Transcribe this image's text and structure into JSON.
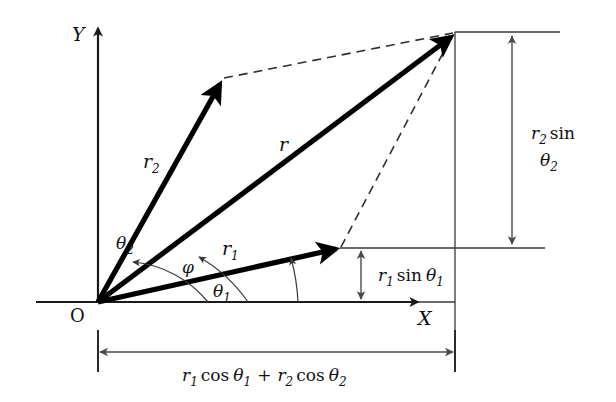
{
  "figure": {
    "type": "vector-addition-parallelogram-diagram",
    "axes": {
      "x_label": "X",
      "y_label": "Y",
      "origin_label": "O"
    },
    "vectors": [
      {
        "name": "r2-vector",
        "label": "r",
        "subscript": "2"
      },
      {
        "name": "resultant-vector",
        "label": "r",
        "subscript": ""
      },
      {
        "name": "r1-vector",
        "label": "r",
        "subscript": "1"
      }
    ],
    "angles": [
      {
        "name": "theta2",
        "symbol": "θ",
        "subscript": "2"
      },
      {
        "name": "phi",
        "symbol": "φ",
        "subscript": ""
      },
      {
        "name": "theta1",
        "symbol": "θ",
        "subscript": "1"
      }
    ],
    "dimensions": {
      "vertical_upper": {
        "prefix": "r",
        "prefix_sub": "2",
        "func": "sin",
        "arg": "θ",
        "arg_sub": "2",
        "full": "r2 sin θ2"
      },
      "vertical_lower": {
        "prefix": "r",
        "prefix_sub": "1",
        "func": "sin",
        "arg": "θ",
        "arg_sub": "1",
        "full": "r1 sin θ1"
      },
      "horizontal_bottom": {
        "term1_prefix": "r",
        "term1_sub": "1",
        "term1_func": "cos",
        "term1_arg": "θ",
        "term1_arg_sub": "1",
        "operator": "+",
        "term2_prefix": "r",
        "term2_sub": "2",
        "term2_func": "cos",
        "term2_arg": "θ",
        "term2_arg_sub": "2",
        "full": "r1 cos θ1 + r2 cos θ2"
      }
    },
    "colors": {
      "background": "#ffffff",
      "vector_stroke": "#000000",
      "axis_stroke": "#1a1a1a",
      "construction_stroke": "#3a3a3a",
      "text": "#111111"
    }
  }
}
